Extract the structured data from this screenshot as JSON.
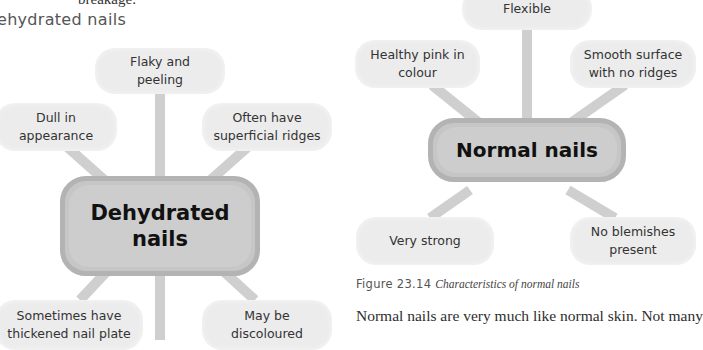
{
  "page": {
    "top_fragment": "breakage.",
    "section_heading": "ehydrated nails",
    "body_text": "Normal nails are very much like normal skin. Not many"
  },
  "dehydrated_diagram": {
    "center": [
      "Dehydrated",
      "nails"
    ],
    "nodes": [
      {
        "id": "flaky",
        "lines": [
          "Flaky and",
          "peeling"
        ]
      },
      {
        "id": "dull",
        "lines": [
          "Dull in",
          "appearance"
        ]
      },
      {
        "id": "ridges",
        "lines": [
          "Often have",
          "superficial ridges"
        ]
      },
      {
        "id": "thickened",
        "lines": [
          "Sometimes have",
          "thickened nail plate"
        ]
      },
      {
        "id": "discoloured",
        "lines": [
          "May be",
          "discoloured"
        ]
      }
    ]
  },
  "normal_diagram": {
    "center": "Normal nails",
    "nodes": [
      {
        "id": "flexible",
        "lines": [
          "Flexible"
        ]
      },
      {
        "id": "pink",
        "lines": [
          "Healthy pink in",
          "colour"
        ]
      },
      {
        "id": "smooth",
        "lines": [
          "Smooth surface",
          "with no ridges"
        ]
      },
      {
        "id": "strong",
        "lines": [
          "Very strong"
        ]
      },
      {
        "id": "blemishes",
        "lines": [
          "No blemishes",
          "present"
        ]
      }
    ],
    "caption": {
      "label": "Figure 23.14",
      "title": "Characteristics of normal nails"
    }
  },
  "colors": {
    "node_fill": "#ececec",
    "center_fill": "#c6c6c6",
    "center_border": "#b3b3b3",
    "connector": "#cfcfcf"
  }
}
